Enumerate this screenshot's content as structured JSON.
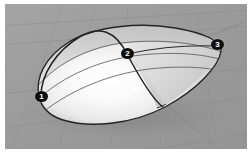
{
  "viewport": {
    "label": "3d-surface-viewport",
    "background_color": "#9a9a9a",
    "frame_color": "#ffffff",
    "grid_color": "#8d8d8d",
    "grid_highlight_color": "#b4b4b4"
  },
  "surface": {
    "name": "lens-shell-surface",
    "fill_light": "#ffffff",
    "fill_mid": "#e6e6e6",
    "fill_dark": "#b9b9b9",
    "edge_color": "#2b2b2b",
    "isoparm_color": "#5a5a5a"
  },
  "markers": [
    {
      "id": "marker-1",
      "label": "1",
      "x": 36,
      "y": 92
    },
    {
      "id": "marker-2",
      "label": "2",
      "x": 122,
      "y": 50
    },
    {
      "id": "marker-3",
      "label": "3",
      "x": 212,
      "y": 41
    }
  ],
  "axes": {
    "ground_line_color": "#8a8a8a"
  }
}
